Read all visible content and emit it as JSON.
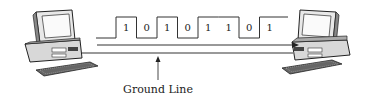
{
  "diagram": {
    "bits": [
      "1",
      "0",
      "1",
      "0",
      "1",
      "1",
      "0",
      "1"
    ],
    "ground_label": "Ground Line",
    "left_device": "computer",
    "right_device": "computer",
    "colors": {
      "line": "#333333",
      "ground": "#777777"
    }
  }
}
